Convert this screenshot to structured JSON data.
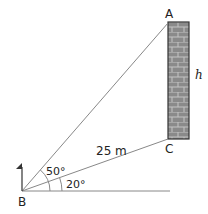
{
  "diagram": {
    "points": {
      "A": "A",
      "B": "B",
      "C": "C"
    },
    "side_label": "h",
    "distance_label": "25 m",
    "angle_upper": "50°",
    "angle_lower": "20°",
    "colors": {
      "line": "#888888",
      "wall_fill": "#8a8a8a",
      "wall_border": "#333333",
      "brick_line": "#bdbdbd",
      "flag": "#333333"
    }
  }
}
